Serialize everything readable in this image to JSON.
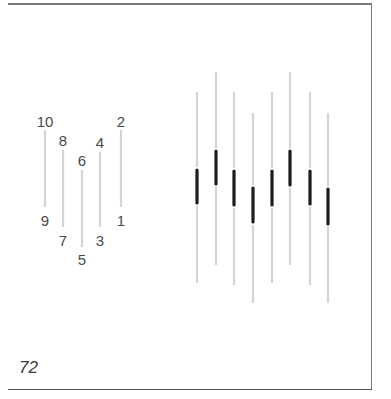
{
  "figure": {
    "page_number": "72",
    "colors": {
      "light_line": "#d4d4d4",
      "dark_segment": "#1e1e1e",
      "label": "#4a4a4a",
      "frame": "#7a7a7a"
    },
    "left_group": {
      "description": "Five numbered vertical lines arranged in a V shape",
      "lines": [
        {
          "top_label": "10",
          "bottom_label": "9",
          "x": 45,
          "y1": 130,
          "y2": 207,
          "top_label_y": 127,
          "bottom_label_y": 226
        },
        {
          "top_label": "8",
          "bottom_label": "7",
          "x": 63,
          "y1": 150,
          "y2": 227,
          "top_label_y": 146,
          "bottom_label_y": 246
        },
        {
          "top_label": "6",
          "bottom_label": "5",
          "x": 82,
          "y1": 170,
          "y2": 247,
          "top_label_y": 166,
          "bottom_label_y": 265
        },
        {
          "top_label": "4",
          "bottom_label": "3",
          "x": 100,
          "y1": 152,
          "y2": 227,
          "top_label_y": 148,
          "bottom_label_y": 246
        },
        {
          "top_label": "2",
          "bottom_label": "1",
          "x": 121,
          "y1": 130,
          "y2": 207,
          "top_label_y": 127,
          "bottom_label_y": 226
        }
      ]
    },
    "right_group": {
      "description": "Eight light vertical lines each with a dark central segment",
      "lines": [
        {
          "x": 197,
          "y1": 92,
          "y2": 283,
          "dark_y1": 170,
          "dark_y2": 203
        },
        {
          "x": 216,
          "y1": 72,
          "y2": 265,
          "dark_y1": 151,
          "dark_y2": 184
        },
        {
          "x": 234,
          "y1": 92,
          "y2": 285,
          "dark_y1": 171,
          "dark_y2": 205
        },
        {
          "x": 253,
          "y1": 113,
          "y2": 303,
          "dark_y1": 188,
          "dark_y2": 222
        },
        {
          "x": 272,
          "y1": 92,
          "y2": 283,
          "dark_y1": 171,
          "dark_y2": 205
        },
        {
          "x": 290,
          "y1": 72,
          "y2": 265,
          "dark_y1": 151,
          "dark_y2": 185
        },
        {
          "x": 310,
          "y1": 92,
          "y2": 285,
          "dark_y1": 171,
          "dark_y2": 204
        },
        {
          "x": 328,
          "y1": 113,
          "y2": 303,
          "dark_y1": 189,
          "dark_y2": 224
        }
      ]
    }
  }
}
